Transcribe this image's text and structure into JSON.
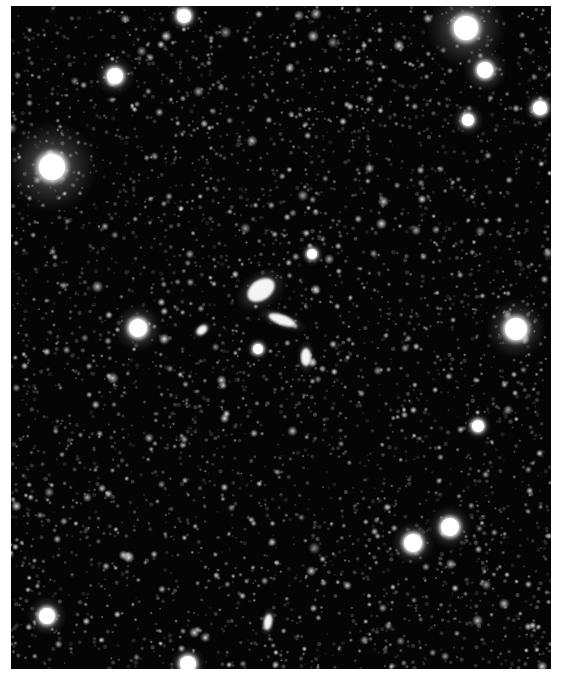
{
  "image": {
    "kind": "astronomical deep-field image",
    "palette": "grayscale, white sources on black sky",
    "background_color": "#050505",
    "margin_color": "#ffffff",
    "field_box": {
      "x": 11,
      "y": 6,
      "width": 540,
      "height": 663
    }
  },
  "bright_stars": [
    {
      "x": 52,
      "y": 167,
      "r": 13,
      "halo": 46,
      "spikes": true
    },
    {
      "x": 466,
      "y": 28,
      "r": 12,
      "halo": 40,
      "spikes": true
    },
    {
      "x": 485,
      "y": 70,
      "r": 8,
      "halo": 22,
      "spikes": false
    },
    {
      "x": 516,
      "y": 329,
      "r": 11,
      "halo": 30,
      "spikes": false
    },
    {
      "x": 138,
      "y": 328,
      "r": 9,
      "halo": 24,
      "spikes": false
    },
    {
      "x": 115,
      "y": 76,
      "r": 8,
      "halo": 20,
      "spikes": false
    },
    {
      "x": 450,
      "y": 527,
      "r": 9,
      "halo": 22,
      "spikes": false
    },
    {
      "x": 413,
      "y": 543,
      "r": 9,
      "halo": 22,
      "spikes": false
    },
    {
      "x": 47,
      "y": 616,
      "r": 8,
      "halo": 20,
      "spikes": false
    },
    {
      "x": 184,
      "y": 16,
      "r": 7,
      "halo": 16,
      "spikes": false
    },
    {
      "x": 540,
      "y": 108,
      "r": 7,
      "halo": 16,
      "spikes": false
    },
    {
      "x": 468,
      "y": 120,
      "r": 6,
      "halo": 16,
      "spikes": false
    },
    {
      "x": 478,
      "y": 426,
      "r": 6,
      "halo": 14,
      "spikes": false
    },
    {
      "x": 188,
      "y": 664,
      "r": 8,
      "halo": 18,
      "spikes": false
    },
    {
      "x": 258,
      "y": 349,
      "r": 5,
      "halo": 12,
      "spikes": false
    },
    {
      "x": 312,
      "y": 254,
      "r": 5,
      "halo": 12,
      "spikes": false
    }
  ],
  "galaxies": [
    {
      "x": 261,
      "y": 290,
      "rx": 15,
      "ry": 10,
      "angle": -35
    },
    {
      "x": 282,
      "y": 320,
      "rx": 14,
      "ry": 5,
      "angle": 20
    },
    {
      "x": 306,
      "y": 357,
      "rx": 5,
      "ry": 9,
      "angle": 0
    },
    {
      "x": 202,
      "y": 330,
      "rx": 6,
      "ry": 4,
      "angle": -40
    },
    {
      "x": 268,
      "y": 622,
      "rx": 4,
      "ry": 8,
      "angle": 10
    }
  ],
  "faint_stars": {
    "count": 1400,
    "seed": 20240607
  }
}
